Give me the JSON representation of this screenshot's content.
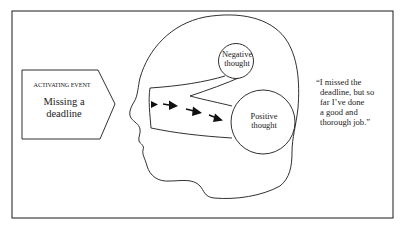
{
  "diagram": {
    "activating_event": {
      "caption": "ACTIVATING EVENT",
      "text": "Missing a deadline"
    },
    "head": {
      "negative_thought": {
        "label_line1": "Negative",
        "label_line2": "thought"
      },
      "positive_thought": {
        "label_line1": "Positive",
        "label_line2": "thought"
      },
      "arrows": [
        "arrow-1",
        "arrow-2",
        "arrow-3",
        "arrow-4"
      ]
    },
    "quote": {
      "lines": [
        "“I missed the",
        "deadline, but so",
        "far I’ve done",
        "a good and",
        "thorough job.”"
      ]
    },
    "colors": {
      "stroke": "#1a1a1a",
      "background": "#ffffff"
    }
  }
}
